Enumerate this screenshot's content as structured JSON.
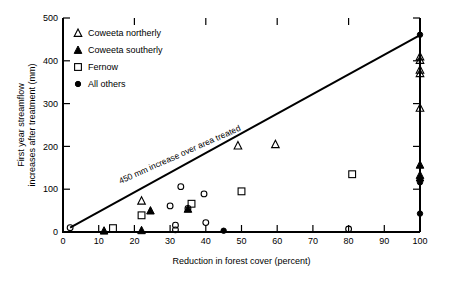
{
  "chart_data": {
    "type": "scatter",
    "title": "",
    "xlabel": "Reduction in forest cover (percent)",
    "ylabel": "First year streamflow increases after treatment (mm)",
    "ylabel_line1": "First year streamflow",
    "ylabel_line2": "increases after treatment (mm)",
    "xlim": [
      0,
      100
    ],
    "ylim": [
      0,
      500
    ],
    "xticks": [
      0,
      10,
      20,
      30,
      40,
      50,
      60,
      70,
      80,
      90,
      100
    ],
    "yticks": [
      0,
      100,
      200,
      300,
      400,
      500
    ],
    "xtick_labels": [
      "0",
      "10",
      "20",
      "30",
      "40",
      "50",
      "60",
      "70",
      "80",
      "90",
      "100"
    ],
    "ytick_labels": [
      "0",
      "100",
      "200",
      "300",
      "400",
      "500"
    ],
    "grid": false,
    "legend_position": "upper-left",
    "annotations": [
      {
        "name": "reference-line-label",
        "text": "450 mm increase over area treated",
        "x": 33,
        "y": 175,
        "rotation": -24
      }
    ],
    "reference_line": {
      "name": "450-mm-reference-line",
      "label": "450 mm increase over area treated",
      "x0": 2,
      "y0": 10,
      "x1": 100,
      "y1": 460
    },
    "series": [
      {
        "name": "Coweeta northerly",
        "marker": "open-triangle",
        "color": "#000000",
        "points": [
          {
            "x": 22,
            "y": 73
          },
          {
            "x": 49,
            "y": 202
          },
          {
            "x": 59.5,
            "y": 205
          },
          {
            "x": 100,
            "y": 410
          },
          {
            "x": 100,
            "y": 402
          },
          {
            "x": 100,
            "y": 379
          },
          {
            "x": 100,
            "y": 371
          },
          {
            "x": 100,
            "y": 290
          }
        ]
      },
      {
        "name": "Coweeta southerly",
        "marker": "filled-triangle",
        "color": "#000000",
        "points": [
          {
            "x": 11.5,
            "y": 3
          },
          {
            "x": 22,
            "y": 4
          },
          {
            "x": 24.5,
            "y": 50
          },
          {
            "x": 35,
            "y": 54
          },
          {
            "x": 100,
            "y": 157
          },
          {
            "x": 100,
            "y": 133
          },
          {
            "x": 100,
            "y": 127
          }
        ]
      },
      {
        "name": "Fernow",
        "marker": "open-square",
        "color": "#000000",
        "points": [
          {
            "x": 14,
            "y": 9
          },
          {
            "x": 22,
            "y": 39
          },
          {
            "x": 36,
            "y": 66
          },
          {
            "x": 50,
            "y": 95
          },
          {
            "x": 81,
            "y": 135
          }
        ]
      },
      {
        "name": "All others",
        "marker": "open-circle",
        "color": "#000000",
        "points": [
          {
            "x": 2,
            "y": 10
          },
          {
            "x": 30,
            "y": 61
          },
          {
            "x": 31.5,
            "y": 16
          },
          {
            "x": 31.5,
            "y": 5
          },
          {
            "x": 33,
            "y": 106
          },
          {
            "x": 35,
            "y": 55
          },
          {
            "x": 39.5,
            "y": 89
          },
          {
            "x": 40,
            "y": 22
          },
          {
            "x": 80,
            "y": 7
          }
        ]
      },
      {
        "name": "All others filled",
        "marker": "filled-circle",
        "color": "#000000",
        "points": [
          {
            "x": 45,
            "y": 3
          },
          {
            "x": 100,
            "y": 461
          },
          {
            "x": 100,
            "y": 116
          },
          {
            "x": 100,
            "y": 43
          }
        ]
      }
    ],
    "legend": [
      {
        "label": "Coweeta northerly",
        "marker": "open-triangle"
      },
      {
        "label": "Coweeta southerly",
        "marker": "filled-triangle"
      },
      {
        "label": "Fernow",
        "marker": "open-square"
      },
      {
        "label": "All others",
        "marker": "filled-circle"
      }
    ]
  }
}
